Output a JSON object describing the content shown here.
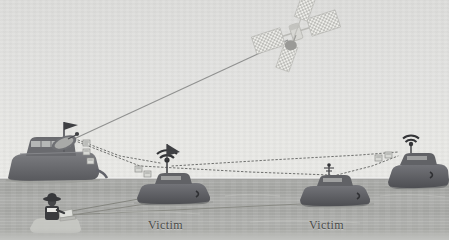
{
  "figure": {
    "type": "maritime-satellite-spoofing-diagram",
    "palette": {
      "sky": "#e2e2e0",
      "sea": "#adaeaa",
      "hull_dark": "#55565a",
      "hull_mid": "#6e6f72",
      "line_solid": "#8e8f8c",
      "line_dotted": "#6f706e",
      "label_text": "#4a4a49",
      "satellite_body": "#c9c9c6",
      "satellite_panel": "#e6e6e3",
      "antenna_dark": "#3f4043"
    },
    "sea_horizon_y": 179
  },
  "labels": [
    {
      "id": "victim-center",
      "text": "Victim",
      "x": 148,
      "y": 218
    },
    {
      "id": "victim-right",
      "text": "Victim",
      "x": 309,
      "y": 218
    }
  ],
  "entities": {
    "satellite": {
      "name": "satellite",
      "x": 296,
      "y": 30,
      "description": "communications satellite with two solar panel wings"
    },
    "attacker_ship": {
      "name": "attacker-vessel",
      "x": 60,
      "y": 165,
      "has_dish": true,
      "has_flag": true,
      "description": "large vessel with parabolic satellite dish and mast flag"
    },
    "victim_ship_center": {
      "name": "victim-vessel-center",
      "x": 175,
      "y": 195,
      "has_antenna": true,
      "has_flag": true,
      "label": "Victim"
    },
    "victim_ship_right": {
      "name": "victim-vessel-right",
      "x": 336,
      "y": 198,
      "has_antenna": true,
      "label": "Victim"
    },
    "far_right_ship": {
      "name": "receiver-vessel-right",
      "x": 412,
      "y": 180,
      "has_antenna": true
    },
    "operator": {
      "name": "operator-figure",
      "x": 52,
      "y": 214,
      "description": "hatted figure at bottom-left operating equipment"
    }
  },
  "links": [
    {
      "id": "uplink",
      "from": "attacker_ship",
      "to": "satellite",
      "style": "solid"
    },
    {
      "id": "attacker-to-victim-center",
      "from": "attacker_ship",
      "to": "victim_ship_center",
      "style": "dotted"
    },
    {
      "id": "attacker-to-victim-right",
      "from": "attacker_ship",
      "to": "victim_ship_right",
      "style": "dotted"
    },
    {
      "id": "victim-center-to-far-right",
      "from": "victim_ship_center",
      "to": "far_right_ship",
      "style": "dotted"
    },
    {
      "id": "victim-right-to-far-right",
      "from": "victim_ship_right",
      "to": "far_right_ship",
      "style": "dotted"
    },
    {
      "id": "operator-to-victim-center",
      "from": "operator",
      "to": "victim_ship_center",
      "style": "solid"
    },
    {
      "id": "operator-to-victim-right",
      "from": "operator",
      "to": "victim_ship_right",
      "style": "solid"
    }
  ],
  "packet_icons": [
    {
      "id": "packet-attacker-1",
      "x": 83,
      "y": 143
    },
    {
      "id": "packet-attacker-2",
      "x": 83,
      "y": 152
    },
    {
      "id": "packet-attacker-3",
      "x": 88,
      "y": 160
    },
    {
      "id": "packet-victim-center-1",
      "x": 137,
      "y": 168
    },
    {
      "id": "packet-victim-center-2",
      "x": 145,
      "y": 173
    },
    {
      "id": "packet-far-right-1",
      "x": 377,
      "y": 157
    },
    {
      "id": "packet-far-right-2",
      "x": 387,
      "y": 155
    }
  ]
}
